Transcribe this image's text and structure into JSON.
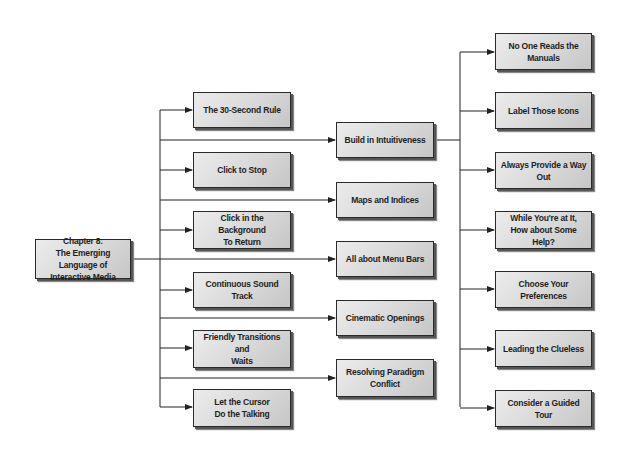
{
  "diagram": {
    "root": {
      "label": "Chapter 8:\nThe Emerging Language of\nInteractive Media"
    },
    "column1": [
      {
        "label": "The 30-Second Rule"
      },
      {
        "label": "Click to Stop"
      },
      {
        "label": "Click in the Background\nTo Return"
      },
      {
        "label": "Continuous Sound Track"
      },
      {
        "label": "Friendly Transitions and\nWaits"
      },
      {
        "label": "Let the Cursor\nDo the Talking"
      }
    ],
    "column2": [
      {
        "label": "Build in Intuitiveness"
      },
      {
        "label": "Maps and Indices"
      },
      {
        "label": "All about Menu Bars"
      },
      {
        "label": "Cinematic Openings"
      },
      {
        "label": "Resolving Paradigm\nConflict"
      }
    ],
    "column3": [
      {
        "label": "No One Reads the Manuals"
      },
      {
        "label": "Label Those Icons"
      },
      {
        "label": "Always Provide a Way Out"
      },
      {
        "label": "While You're at It,\nHow about Some Help?"
      },
      {
        "label": "Choose Your Preferences"
      },
      {
        "label": "Leading the Clueless"
      },
      {
        "label": "Consider a Guided Tour"
      }
    ],
    "column3_parent": "Build in Intuitiveness",
    "colors": {
      "line": "#222222",
      "box_border": "#2a2a2a",
      "box_fill_light": "#ececec",
      "box_fill_dark": "#c6c6c6",
      "text": "#1e1e1e"
    }
  }
}
